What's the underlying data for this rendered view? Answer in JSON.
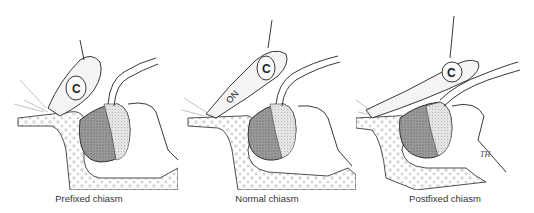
{
  "figure": {
    "panels": [
      {
        "caption": "Prefixed chiasm",
        "label_c": "C"
      },
      {
        "caption": "Normal chiasm",
        "label_c": "C",
        "label_on": "ON"
      },
      {
        "caption": "Postfixed chiasm",
        "label_c": "C"
      }
    ],
    "signature": "TH"
  },
  "colors": {
    "line": "#222222",
    "gland_dark": "#8a8a8a",
    "gland_light": "#d6d6d6",
    "nerve": "#f2f2f2"
  }
}
